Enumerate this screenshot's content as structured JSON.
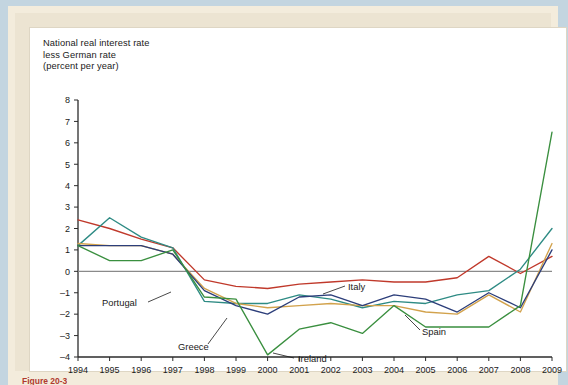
{
  "page": {
    "background_color": "#c3d5e0",
    "paper_color": "#ece4d2",
    "figure_background": "#ffffff"
  },
  "title": "National real interest rate\nless German rate\n(percent per year)",
  "caption": "Figure 20-3",
  "axis": {
    "y_ticks": [
      "8",
      "7",
      "6",
      "5",
      "4",
      "3",
      "2",
      "1",
      "0",
      "-1",
      "-2",
      "-3",
      "-4"
    ],
    "x_ticks": [
      "1994",
      "1995",
      "1996",
      "1997",
      "1998",
      "1999",
      "2000",
      "2001",
      "2002",
      "2003",
      "2004",
      "2005",
      "2006",
      "2007",
      "2008",
      "2009"
    ],
    "zero_line_color": "#8a8a8a"
  },
  "series_labels": {
    "portugal": "Portugal",
    "greece": "Greece",
    "ireland": "Ireland",
    "italy": "Italy",
    "spain": "Spain"
  },
  "chart_data": {
    "type": "line",
    "title": "National real interest rate less German rate (percent per year)",
    "xlabel": "",
    "ylabel": "National real interest rate less German rate (percent per year)",
    "xlim": [
      1994,
      2009
    ],
    "ylim": [
      -4,
      8
    ],
    "y_ticks": [
      -4,
      -3,
      -2,
      -1,
      0,
      1,
      2,
      3,
      4,
      5,
      6,
      7,
      8
    ],
    "grid": false,
    "legend": "inline-annotations",
    "x": [
      1994,
      1995,
      1996,
      1997,
      1998,
      1999,
      2000,
      2001,
      2002,
      2003,
      2004,
      2005,
      2006,
      2007,
      2008,
      2009
    ],
    "series": [
      {
        "name": "Italy",
        "color": "#c0392b",
        "values": [
          2.4,
          2.0,
          1.5,
          1.1,
          -0.4,
          -0.7,
          -0.8,
          -0.6,
          -0.5,
          -0.4,
          -0.5,
          -0.5,
          -0.3,
          0.7,
          -0.1,
          0.7
        ]
      },
      {
        "name": "Greece",
        "color": "#2e8b84",
        "values": [
          1.2,
          2.5,
          1.6,
          1.1,
          -1.4,
          -1.5,
          -1.5,
          -1.1,
          -1.3,
          -1.7,
          -1.4,
          -1.5,
          -1.1,
          -0.9,
          0.1,
          2.0
        ]
      },
      {
        "name": "Portugal",
        "color": "#d2a24c",
        "values": [
          1.3,
          1.2,
          1.2,
          0.8,
          -0.8,
          -1.5,
          -1.7,
          -1.6,
          -1.5,
          -1.6,
          -1.6,
          -1.9,
          -2.0,
          -1.1,
          -1.9,
          1.3
        ]
      },
      {
        "name": "Spain",
        "color": "#2c3e7a",
        "values": [
          1.2,
          1.2,
          1.2,
          0.8,
          -0.9,
          -1.6,
          -2.0,
          -1.2,
          -1.1,
          -1.6,
          -1.1,
          -1.3,
          -1.9,
          -1.0,
          -1.7,
          1.0
        ]
      },
      {
        "name": "Ireland",
        "color": "#3a8f3f",
        "values": [
          1.2,
          0.5,
          0.5,
          1.0,
          -1.2,
          -1.3,
          -3.9,
          -2.7,
          -2.4,
          -2.9,
          -1.6,
          -2.6,
          -2.6,
          -2.6,
          -1.6,
          6.5
        ]
      }
    ]
  }
}
